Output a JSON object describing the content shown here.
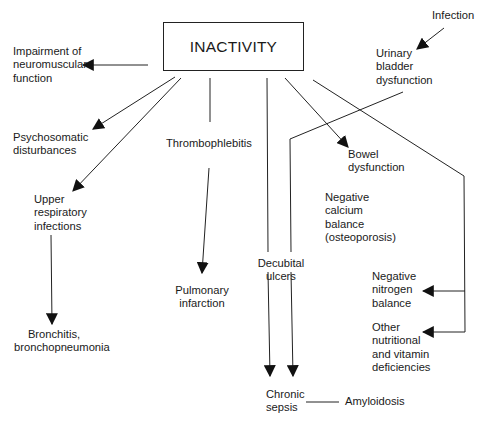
{
  "diagram": {
    "root": {
      "label": "INACTIVITY"
    },
    "nodes": {
      "impairment": "Impairment of\nneuromuscular\nfunction",
      "psychosomatic": "Psychosomatic\ndisturbances",
      "upper_respiratory": "Upper\nrespiratory\ninfections",
      "bronchitis": "Bronchitis,\nbronchopneumonia",
      "thrombophlebitis": "Thrombophlebitis",
      "pulmonary_infarction": "Pulmonary\ninfarction",
      "decubital_ulcers": "Decubital\nulcers",
      "chronic_sepsis": "Chronic\nsepsis",
      "amyloidosis": "Amyloidosis",
      "infection": "Infection",
      "urinary_bladder": "Urinary\nbladder\ndysfunction",
      "bowel": "Bowel\ndysfunction",
      "negative_calcium": "Negative\ncalcium\nbalance\n(osteoporosis)",
      "negative_nitrogen": "Negative\nnitrogen\nbalance",
      "other_nutritional": "Other\nnutritional\nand vitamin\ndeficiencies"
    },
    "edges": [
      {
        "from": "INACTIVITY",
        "to": "Impairment of neuromuscular function",
        "arrow": true
      },
      {
        "from": "INACTIVITY",
        "to": "Psychosomatic disturbances",
        "arrow": true
      },
      {
        "from": "INACTIVITY",
        "to": "Upper respiratory infections",
        "arrow": true
      },
      {
        "from": "Upper respiratory infections",
        "to": "Bronchitis, bronchopneumonia",
        "arrow": true
      },
      {
        "from": "INACTIVITY",
        "to": "Thrombophlebitis",
        "arrow": false
      },
      {
        "from": "Thrombophlebitis",
        "to": "Pulmonary infarction",
        "arrow": true
      },
      {
        "from": "INACTIVITY",
        "to": "Decubital ulcers",
        "arrow": false
      },
      {
        "from": "Decubital ulcers",
        "to": "Chronic sepsis",
        "arrow": true
      },
      {
        "from": "Urinary bladder dysfunction",
        "to": "Chronic sepsis",
        "arrow": true
      },
      {
        "from": "Infection",
        "to": "Urinary bladder dysfunction",
        "arrow": true
      },
      {
        "from": "INACTIVITY",
        "to": "Bowel dysfunction",
        "arrow": true
      },
      {
        "from": "INACTIVITY",
        "to": "Negative nitrogen balance",
        "arrow": true
      },
      {
        "from": "INACTIVITY",
        "to": "Other nutritional and vitamin deficiencies",
        "arrow": true
      },
      {
        "from": "Chronic sepsis",
        "to": "Amyloidosis",
        "arrow": false
      }
    ],
    "colors": {
      "ink": "#1a1a1a",
      "background": "#ffffff"
    }
  }
}
